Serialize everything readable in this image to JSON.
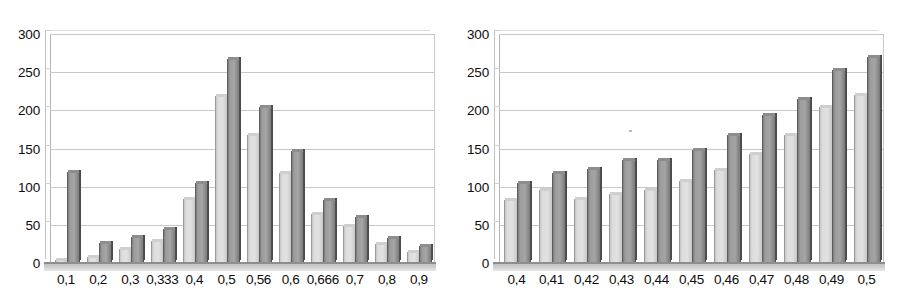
{
  "figure": {
    "panels": [
      "left-chart",
      "right-chart"
    ],
    "background_color": "#ffffff",
    "series_colors": {
      "series_1_light": "#dcdcdc",
      "series_2_dark": "#9d9d9d"
    }
  },
  "chart_data": [
    {
      "id": "left-chart",
      "type": "bar",
      "title": "",
      "xlabel": "",
      "ylabel": "",
      "ylim": [
        0,
        300
      ],
      "yticks": [
        0,
        50,
        100,
        150,
        200,
        250,
        300
      ],
      "ytick_labels": [
        "0",
        "50",
        "100",
        "150",
        "200",
        "250",
        "300"
      ],
      "grid": true,
      "legend": "none",
      "categories": [
        "0,1",
        "0,2",
        "0,3",
        "0,333",
        "0,4",
        "0,5",
        "0,56",
        "0,6",
        "0,666",
        "0,7",
        "0,8",
        "0,9"
      ],
      "series": [
        {
          "name": "series 1",
          "color": "#dcdcdc",
          "values": [
            2,
            6,
            17,
            28,
            83,
            217,
            166,
            117,
            63,
            47,
            23,
            13
          ]
        },
        {
          "name": "series 2",
          "color": "#9d9d9d",
          "values": [
            118,
            25,
            33,
            43,
            104,
            266,
            203,
            145,
            81,
            59,
            32,
            21
          ]
        }
      ]
    },
    {
      "id": "right-chart",
      "type": "bar",
      "title": "",
      "xlabel": "",
      "ylabel": "",
      "ylim": [
        0,
        300
      ],
      "yticks": [
        0,
        50,
        100,
        150,
        200,
        250,
        300
      ],
      "ytick_labels": [
        "0",
        "50",
        "100",
        "150",
        "200",
        "250",
        "300"
      ],
      "grid": true,
      "legend": "none",
      "categories": [
        "0,4",
        "0,41",
        "0,42",
        "0,43",
        "0,44",
        "0,45",
        "0,46",
        "0,47",
        "0,48",
        "0,49",
        "0,5"
      ],
      "series": [
        {
          "name": "series 1",
          "color": "#dcdcdc",
          "values": [
            81,
            94,
            82,
            89,
            94,
            106,
            121,
            141,
            167,
            203,
            219
          ]
        },
        {
          "name": "series 2",
          "color": "#9d9d9d",
          "values": [
            103,
            117,
            122,
            134,
            134,
            147,
            166,
            192,
            213,
            252,
            269
          ]
        }
      ]
    }
  ]
}
